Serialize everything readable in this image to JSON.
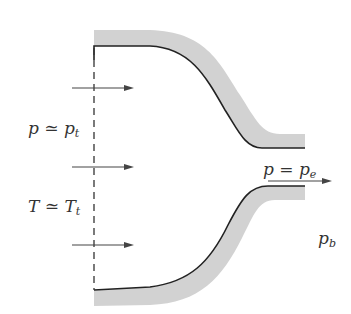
{
  "diagram": {
    "type": "converging nozzle schematic",
    "colors": {
      "wall_shading": "#d2d2d2",
      "wall_line": "#222222",
      "arrow": "#444444",
      "dashed_line": "#333333"
    },
    "labels": {
      "inlet_pressure": {
        "base": "p ≃ p",
        "sub": "t"
      },
      "inlet_temperature": {
        "base": "T ≃ T",
        "sub": "t"
      },
      "exit_pressure": {
        "base": "p = p",
        "sub": "e"
      },
      "back_pressure": {
        "base": "p",
        "sub": "b"
      }
    },
    "inlet_arrows": 3,
    "exit_arrows": 1
  }
}
